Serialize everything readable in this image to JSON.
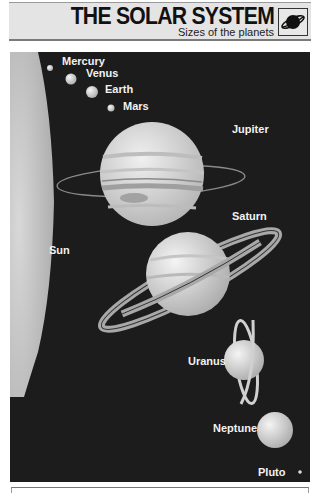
{
  "header": {
    "title": "THE SOLAR SYSTEM",
    "subtitle": "Sizes of the planets",
    "logo_icon": "ringed-planet-icon"
  },
  "illustration": {
    "background_color": "#1c1c1c",
    "bodies": [
      {
        "name": "Sun",
        "label": "Sun"
      },
      {
        "name": "Mercury",
        "label": "Mercury"
      },
      {
        "name": "Venus",
        "label": "Venus"
      },
      {
        "name": "Earth",
        "label": "Earth"
      },
      {
        "name": "Mars",
        "label": "Mars"
      },
      {
        "name": "Jupiter",
        "label": "Jupiter"
      },
      {
        "name": "Saturn",
        "label": "Saturn"
      },
      {
        "name": "Uranus",
        "label": "Uranus"
      },
      {
        "name": "Neptune",
        "label": "Neptune"
      },
      {
        "name": "Pluto",
        "label": "Pluto"
      }
    ]
  }
}
